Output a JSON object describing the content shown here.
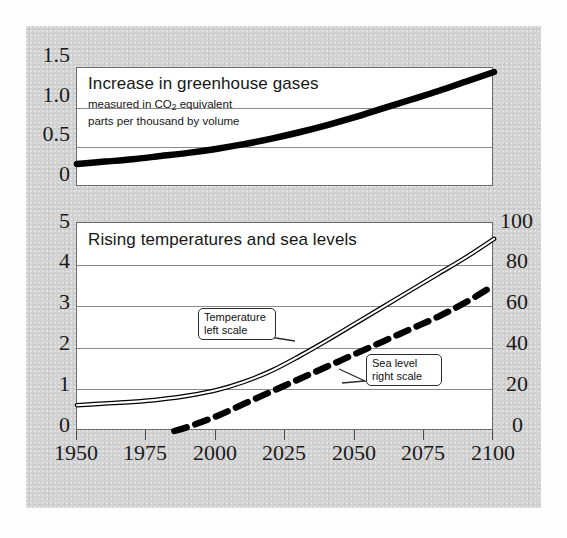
{
  "figure": {
    "background_color": "#d2d2d2",
    "panel_color": "#ffffff",
    "line_color": "#000000"
  },
  "top_panel": {
    "title": "Increase in greenhouse gases",
    "subtitle_line1": "measured in CO",
    "subtitle_sub": "2",
    "subtitle_line1b": " equivalent",
    "subtitle_line2": "parts per thousand by volume",
    "y_ticks": [
      "1.5",
      "1.0",
      "0.5",
      "0"
    ]
  },
  "bottom_panel": {
    "title": "Rising temperatures and sea levels",
    "y_ticks_left": [
      "5",
      "4",
      "3",
      "2",
      "1",
      "0"
    ],
    "y_ticks_right": [
      "100",
      "80",
      "60",
      "40",
      "20",
      "0"
    ],
    "callout_temperature": "Temperature\nleft scale",
    "callout_sealevel": "Sea level\nright scale"
  },
  "x_axis": {
    "ticks": [
      "1950",
      "1975",
      "2000",
      "2025",
      "2050",
      "2075",
      "2100"
    ]
  },
  "chart_data": [
    {
      "type": "line",
      "title": "Increase in greenhouse gases",
      "subtitle": "measured in CO2 equivalent parts per thousand by volume",
      "xlabel": "",
      "ylabel": "",
      "xlim": [
        1950,
        2100
      ],
      "ylim": [
        0,
        1.5
      ],
      "yticks": [
        0,
        0.5,
        1.0,
        1.5
      ],
      "xticks": [
        1950,
        1975,
        2000,
        2025,
        2050,
        2075,
        2100
      ],
      "grid": true,
      "legend": "none",
      "series": [
        {
          "name": "Greenhouse gas concentration (CO2 equivalent, parts per thousand)",
          "style": "thick-solid",
          "x": [
            1950,
            1960,
            1970,
            1980,
            1990,
            2000,
            2010,
            2020,
            2030,
            2040,
            2050,
            2060,
            2070,
            2080,
            2090,
            2100
          ],
          "y": [
            0.29,
            0.32,
            0.35,
            0.39,
            0.43,
            0.48,
            0.54,
            0.61,
            0.69,
            0.78,
            0.88,
            0.99,
            1.1,
            1.21,
            1.33,
            1.45
          ]
        }
      ]
    },
    {
      "type": "line",
      "title": "Rising temperatures and sea levels",
      "xlabel": "",
      "ylabel": "Temperature (left scale)",
      "y2label": "Sea level (right scale)",
      "xlim": [
        1950,
        2100
      ],
      "ylim": [
        0,
        5
      ],
      "y2lim": [
        0,
        100
      ],
      "yticks": [
        0,
        1,
        2,
        3,
        4,
        5
      ],
      "y2ticks": [
        0,
        20,
        40,
        60,
        80,
        100
      ],
      "xticks": [
        1950,
        1975,
        2000,
        2025,
        2050,
        2075,
        2100
      ],
      "grid": true,
      "legend": "callout-annotations",
      "series": [
        {
          "name": "Temperature",
          "axis": "left",
          "style": "double-thin-solid",
          "annotation": "Temperature left scale",
          "x": [
            1950,
            1960,
            1970,
            1980,
            1990,
            2000,
            2010,
            2020,
            2030,
            2040,
            2050,
            2060,
            2070,
            2080,
            2090,
            2100
          ],
          "y": [
            0.62,
            0.66,
            0.7,
            0.76,
            0.85,
            0.98,
            1.18,
            1.45,
            1.8,
            2.18,
            2.58,
            2.98,
            3.38,
            3.78,
            4.18,
            4.62
          ]
        },
        {
          "name": "Sea level",
          "axis": "right",
          "style": "thick-dashed",
          "annotation": "Sea level right scale",
          "x": [
            1985,
            1990,
            2000,
            2010,
            2020,
            2030,
            2040,
            2050,
            2060,
            2070,
            2080,
            2090,
            2100
          ],
          "y": [
            0,
            2,
            7,
            13,
            19,
            25,
            31,
            37,
            43,
            49,
            55,
            62,
            70
          ]
        }
      ]
    }
  ]
}
